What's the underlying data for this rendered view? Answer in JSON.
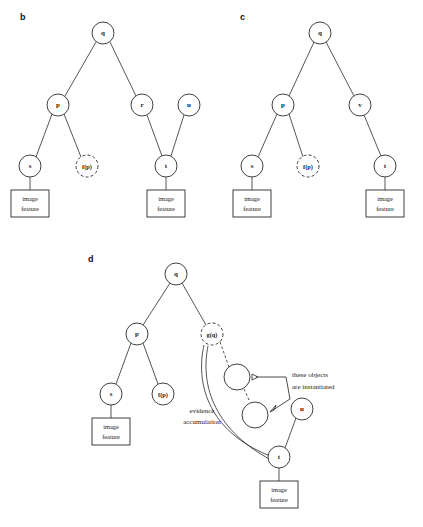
{
  "figure": {
    "background": "#ffffff",
    "stroke_color": "#2b2b2b",
    "text_color": "#1a1a1a",
    "width": 423,
    "height": 527
  },
  "panels": [
    {
      "id": "b",
      "label": "b",
      "label_x": 20,
      "label_y": 20,
      "nodes": [
        {
          "name": "q",
          "label": "q",
          "x": 103,
          "y": 33,
          "r": 11,
          "style": "solid",
          "size": "normal"
        },
        {
          "name": "p",
          "label": "p",
          "x": 58,
          "y": 105,
          "r": 11,
          "style": "solid",
          "size": "normal"
        },
        {
          "name": "r",
          "label": "r",
          "x": 142,
          "y": 105,
          "r": 11,
          "style": "solid",
          "size": "normal"
        },
        {
          "name": "u",
          "label": "u",
          "x": 189,
          "y": 105,
          "r": 11,
          "style": "solid",
          "size": "normal"
        },
        {
          "name": "s",
          "label": "s",
          "x": 30,
          "y": 166,
          "r": 11,
          "style": "solid",
          "size": "normal"
        },
        {
          "name": "f-p",
          "label": "f(p)",
          "x": 87,
          "y": 166,
          "r": 11,
          "style": "dashed",
          "size": "small"
        },
        {
          "name": "t",
          "label": "t",
          "x": 166,
          "y": 166,
          "r": 11,
          "style": "solid",
          "size": "normal"
        }
      ],
      "edges": [
        {
          "from": "q",
          "to": "p"
        },
        {
          "from": "q",
          "to": "r"
        },
        {
          "from": "p",
          "to": "s"
        },
        {
          "from": "p",
          "to": "f-p"
        },
        {
          "from": "r",
          "to": "t"
        },
        {
          "from": "u",
          "to": "t"
        }
      ],
      "leaves": [
        {
          "name": "leaf-s",
          "parent": "s",
          "x": 30,
          "y": 203,
          "w": 38,
          "h": 27,
          "line1": "image",
          "line2": "feature"
        },
        {
          "name": "leaf-t",
          "parent": "t",
          "x": 166,
          "y": 203,
          "w": 38,
          "h": 27,
          "line1": "image",
          "line2": "feature"
        }
      ]
    },
    {
      "id": "c",
      "label": "c",
      "label_x": 240,
      "label_y": 20,
      "nodes": [
        {
          "name": "q",
          "label": "q",
          "x": 320,
          "y": 33,
          "r": 11,
          "style": "solid",
          "size": "normal"
        },
        {
          "name": "p",
          "label": "p",
          "x": 283,
          "y": 105,
          "r": 11,
          "style": "solid",
          "size": "normal"
        },
        {
          "name": "v",
          "label": "v",
          "x": 360,
          "y": 105,
          "r": 11,
          "style": "solid",
          "size": "normal"
        },
        {
          "name": "s",
          "label": "s",
          "x": 252,
          "y": 166,
          "r": 11,
          "style": "solid",
          "size": "normal"
        },
        {
          "name": "f-p",
          "label": "f(p)",
          "x": 308,
          "y": 166,
          "r": 11,
          "style": "dashed",
          "size": "small"
        },
        {
          "name": "t",
          "label": "t",
          "x": 385,
          "y": 166,
          "r": 11,
          "style": "solid",
          "size": "normal"
        }
      ],
      "edges": [
        {
          "from": "q",
          "to": "p"
        },
        {
          "from": "q",
          "to": "v"
        },
        {
          "from": "p",
          "to": "s"
        },
        {
          "from": "p",
          "to": "f-p"
        },
        {
          "from": "v",
          "to": "t"
        }
      ],
      "leaves": [
        {
          "name": "leaf-s",
          "parent": "s",
          "x": 252,
          "y": 203,
          "w": 38,
          "h": 27,
          "line1": "image",
          "line2": "feature"
        },
        {
          "name": "leaf-t",
          "parent": "t",
          "x": 385,
          "y": 203,
          "w": 38,
          "h": 27,
          "line1": "image",
          "line2": "feature"
        }
      ]
    },
    {
      "id": "d",
      "label": "d",
      "label_x": 88,
      "label_y": 262,
      "nodes": [
        {
          "name": "q",
          "label": "q",
          "x": 176,
          "y": 274,
          "r": 11,
          "style": "solid",
          "size": "normal"
        },
        {
          "name": "p",
          "label": "p",
          "x": 137,
          "y": 334,
          "r": 11,
          "style": "solid",
          "size": "normal"
        },
        {
          "name": "g-q",
          "label": "g(q)",
          "x": 212,
          "y": 334,
          "r": 11,
          "style": "dashed",
          "size": "small"
        },
        {
          "name": "s",
          "label": "s",
          "x": 111,
          "y": 394,
          "r": 11,
          "style": "solid",
          "size": "normal"
        },
        {
          "name": "f-p",
          "label": "f(p)",
          "x": 163,
          "y": 394,
          "r": 11,
          "style": "solid",
          "size": "small"
        },
        {
          "name": "obj-1",
          "label": "",
          "x": 237,
          "y": 377,
          "r": 13,
          "style": "solid",
          "size": "normal"
        },
        {
          "name": "obj-2",
          "label": "",
          "x": 255,
          "y": 415,
          "r": 13,
          "style": "solid",
          "size": "normal"
        },
        {
          "name": "u",
          "label": "u",
          "x": 302,
          "y": 409,
          "r": 11,
          "style": "solid",
          "size": "normal"
        },
        {
          "name": "t",
          "label": "t",
          "x": 279,
          "y": 457,
          "r": 11,
          "style": "solid",
          "size": "normal"
        }
      ],
      "edges": [
        {
          "from": "q",
          "to": "p"
        },
        {
          "from": "q",
          "to": "g-q"
        },
        {
          "from": "p",
          "to": "s"
        },
        {
          "from": "p",
          "to": "f-p"
        },
        {
          "from": "u",
          "to": "t"
        }
      ],
      "dashed_links": [
        {
          "name": "gq-to-obj1",
          "from": "g-q",
          "to": "obj-1"
        },
        {
          "name": "obj1-to-obj2",
          "from": "obj-1",
          "to": "obj-2"
        }
      ],
      "leaves": [
        {
          "name": "leaf-s",
          "parent": "s",
          "x": 111,
          "y": 431,
          "w": 38,
          "h": 27,
          "line1": "image",
          "line2": "feature"
        },
        {
          "name": "leaf-t",
          "parent": "t",
          "x": 279,
          "y": 494,
          "w": 38,
          "h": 27,
          "line1": "image",
          "line2": "feature"
        }
      ],
      "annotations": [
        {
          "name": "evidence-accumulation-label",
          "line1": "evidence",
          "line2": "accumulation",
          "x": 202,
          "y": 413
        },
        {
          "name": "these-objects-instantiated-label",
          "line1": "these objects",
          "line2": "are instantiated",
          "x": 318,
          "y": 383
        }
      ]
    }
  ]
}
